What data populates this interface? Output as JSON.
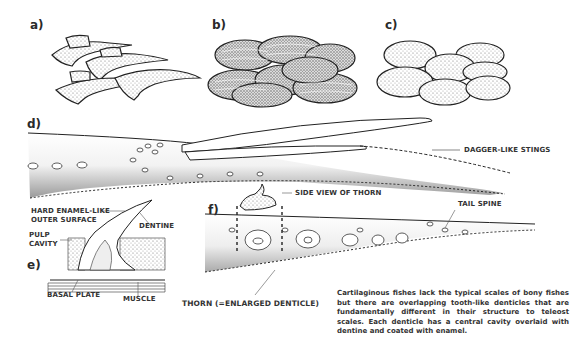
{
  "panels": {
    "a": "a)",
    "b": "b)",
    "c": "c)",
    "d": "d)",
    "e": "e)",
    "f": "f)"
  },
  "labels": {
    "dagger_stings": "DAGGER-LIKE STINGS",
    "side_view_thorn": "SIDE VIEW OF THORN",
    "tail_spine": "TAIL SPINE",
    "hard_enamel_line1": "HARD ENAMEL-LIKE",
    "hard_enamel_line2": "OUTER SURFACE",
    "dentine": "DENTINE",
    "pulp_line1": "PULP",
    "pulp_line2": "CAVITY",
    "basal_plate": "BASAL PLATE",
    "muscle": "MUSCLE",
    "thorn": "THORN (=ENLARGED DENTICLE)"
  },
  "caption": "Cartilaginous fishes lack the typical scales of bony fishes but there are overlapping tooth-like denticles that are fundamentally different in their structure to teleost scales. Each denticle has a central cavity overlaid with dentine and coated with enamel.",
  "colors": {
    "ink": "#2a2a2a",
    "stipple": "#9a9a9a",
    "background": "#ffffff"
  }
}
